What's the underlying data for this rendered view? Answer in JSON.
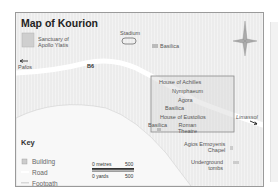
{
  "title": "Map of Kourion",
  "places": [
    {
      "id": "sanctuary",
      "label": "Sanctuary of\nApollo Ylatis"
    },
    {
      "id": "stadium",
      "label": "Stadium"
    },
    {
      "id": "basilica-north",
      "label": "Basilica"
    },
    {
      "id": "house-achilles",
      "label": "House of Achilles"
    },
    {
      "id": "nymphaeum",
      "label": "Nymphaeum"
    },
    {
      "id": "agora",
      "label": "Agora"
    },
    {
      "id": "basilica-site",
      "label": "Basilica"
    },
    {
      "id": "house-eustolios",
      "label": "House of Eustolios"
    },
    {
      "id": "roman-theatre",
      "label": "Roman\nTheatre"
    },
    {
      "id": "basilica-west",
      "label": "Basilica"
    },
    {
      "id": "agios-chapel",
      "label": "Agios Ermoyenis\nChapel"
    },
    {
      "id": "tombs",
      "label": "Underground\ntombs"
    }
  ],
  "road": {
    "number": "B6",
    "west_destination": "Pafos",
    "east_destination": "Limassol"
  },
  "key": {
    "title": "Key",
    "items": [
      {
        "label": "Building",
        "symbol": "building-icon"
      },
      {
        "label": "Road",
        "symbol": "road-swatch"
      },
      {
        "label": "Footpath",
        "symbol": "footpath-swatch"
      }
    ]
  },
  "scale": {
    "metres_start": "0 metres",
    "metres_end": "500",
    "yards_start": "0 yards",
    "yards_end": "500"
  },
  "compass": "compass-rose-icon",
  "colors": {
    "land": "#ececec",
    "road": "#ffffff",
    "sea": "#f7f7f7",
    "inset_border": "#888888",
    "building": "#c8c8c8"
  }
}
